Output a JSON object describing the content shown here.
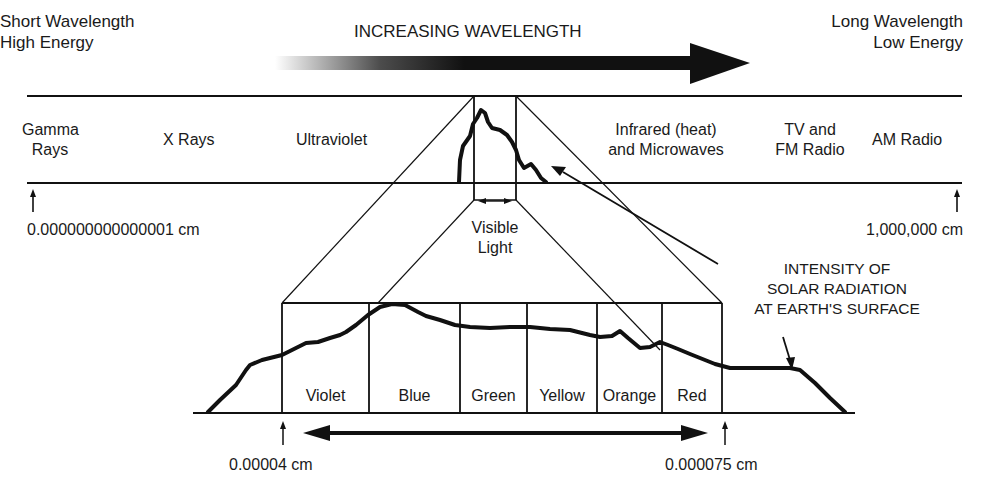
{
  "header": {
    "left_line1": "Short Wavelength",
    "left_line2": "High Energy",
    "center": "INCREASING WAVELENGTH",
    "right_line1": "Long Wavelength",
    "right_line2": "Low Energy"
  },
  "spectrum_bands": [
    {
      "line1": "Gamma",
      "line2": "Rays"
    },
    {
      "line1": "X Rays"
    },
    {
      "line1": "Ultraviolet"
    },
    {
      "line1": "Infrared (heat)",
      "line2": "and Microwaves"
    },
    {
      "line1": "TV and",
      "line2": "FM Radio"
    },
    {
      "line1": "AM Radio"
    }
  ],
  "scale": {
    "min_label": "0.000000000000001 cm",
    "max_label": "1,000,000 cm"
  },
  "visible_light": {
    "line1": "Visible",
    "line2": "Light"
  },
  "annotation": {
    "line1": "INTENSITY OF",
    "line2": "SOLAR RADIATION",
    "line3": "AT EARTH'S SURFACE"
  },
  "color_bands": [
    "Violet",
    "Blue",
    "Green",
    "Yellow",
    "Orange",
    "Red"
  ],
  "visible_range": {
    "start_label": "0.00004 cm",
    "end_label": "0.000075 cm"
  },
  "colors": {
    "ink": "#111111",
    "background": "#ffffff"
  }
}
